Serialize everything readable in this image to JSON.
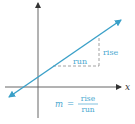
{
  "diagram": {
    "axis_color": "#333333",
    "line_color": "#3aa0c8",
    "label_color": "#4aa8d0",
    "x_axis_label": "x",
    "rise_label": "rise",
    "run_label": "run",
    "formula": {
      "lhs": "m",
      "equals": "=",
      "numerator": "rise",
      "denominator": "run"
    }
  }
}
